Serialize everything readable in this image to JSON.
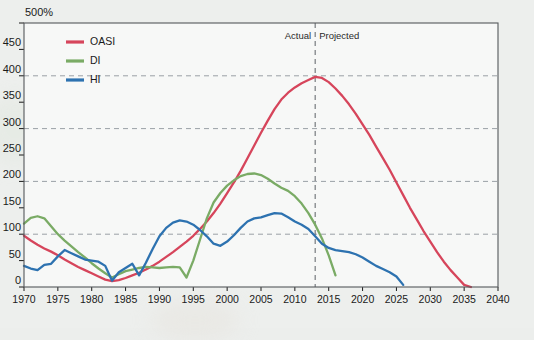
{
  "chart_data": {
    "type": "line",
    "title": "",
    "xlabel": "",
    "ylabel": "",
    "unit_label": "500%",
    "xlim": [
      1970,
      2040
    ],
    "ylim": [
      0,
      500
    ],
    "yticks": [
      0,
      50,
      100,
      150,
      200,
      250,
      300,
      350,
      400,
      450,
      500
    ],
    "ytick_labels": [
      "0",
      "50",
      "100",
      "150",
      "200",
      "250",
      "300",
      "350",
      "400",
      "450",
      "500%"
    ],
    "gridlines_y": [
      100,
      200,
      300,
      400
    ],
    "xticks": [
      1970,
      1975,
      1980,
      1985,
      1990,
      1995,
      2000,
      2005,
      2010,
      2015,
      2020,
      2025,
      2030,
      2035,
      2040
    ],
    "xtick_labels": [
      "1970",
      "1975",
      "1980",
      "1985",
      "1990",
      "1995",
      "2000",
      "2005",
      "2010",
      "2015",
      "2020",
      "2025",
      "2030",
      "2035",
      "2040"
    ],
    "grid": true,
    "legend_position": "top-left",
    "annotations": [
      {
        "name": "actual-label",
        "text": "Actual",
        "x": 2013,
        "align": "right"
      },
      {
        "name": "projected-label",
        "text": "Projected",
        "x": 2013,
        "align": "left"
      },
      {
        "name": "divider",
        "text": "",
        "x": 2013,
        "style": "dashed-vertical"
      }
    ],
    "series": [
      {
        "name": "OASI",
        "color": "#d6455b",
        "x": [
          1970,
          1971,
          1972,
          1973,
          1974,
          1975,
          1976,
          1977,
          1978,
          1979,
          1980,
          1981,
          1982,
          1983,
          1984,
          1985,
          1986,
          1987,
          1988,
          1989,
          1990,
          1991,
          1992,
          1993,
          1994,
          1995,
          1996,
          1997,
          1998,
          1999,
          2000,
          2001,
          2002,
          2003,
          2004,
          2005,
          2006,
          2007,
          2008,
          2009,
          2010,
          2011,
          2012,
          2013,
          2014,
          2015,
          2016,
          2017,
          2018,
          2019,
          2020,
          2021,
          2022,
          2023,
          2024,
          2025,
          2026,
          2027,
          2028,
          2029,
          2030,
          2031,
          2032,
          2033,
          2034,
          2035,
          2036
        ],
        "y": [
          97,
          88,
          80,
          73,
          67,
          60,
          52,
          45,
          38,
          32,
          26,
          20,
          14,
          11,
          13,
          17,
          22,
          27,
          33,
          40,
          48,
          57,
          66,
          76,
          86,
          97,
          110,
          124,
          140,
          158,
          178,
          198,
          220,
          244,
          268,
          292,
          315,
          337,
          355,
          368,
          378,
          386,
          392,
          398,
          396,
          388,
          376,
          362,
          346,
          328,
          308,
          288,
          266,
          244,
          222,
          198,
          174,
          150,
          128,
          106,
          86,
          66,
          48,
          32,
          18,
          4,
          0
        ]
      },
      {
        "name": "DI",
        "color": "#7aab65",
        "x": [
          1970,
          1971,
          1972,
          1973,
          1974,
          1975,
          1976,
          1977,
          1978,
          1979,
          1980,
          1981,
          1982,
          1983,
          1984,
          1985,
          1986,
          1987,
          1988,
          1989,
          1990,
          1991,
          1992,
          1993,
          1994,
          1995,
          1996,
          1997,
          1998,
          1999,
          2000,
          2001,
          2002,
          2003,
          2004,
          2005,
          2006,
          2007,
          2008,
          2009,
          2010,
          2011,
          2012,
          2013,
          2014,
          2015,
          2016
        ],
        "y": [
          120,
          131,
          134,
          130,
          115,
          100,
          88,
          77,
          66,
          56,
          45,
          35,
          26,
          18,
          24,
          30,
          33,
          36,
          38,
          37,
          36,
          37,
          38,
          37,
          18,
          50,
          90,
          130,
          160,
          178,
          192,
          202,
          210,
          214,
          215,
          212,
          205,
          196,
          188,
          182,
          172,
          158,
          140,
          118,
          92,
          60,
          22
        ]
      },
      {
        "name": "HI",
        "color": "#2d72b0",
        "x": [
          1970,
          1971,
          1972,
          1973,
          1974,
          1975,
          1976,
          1977,
          1978,
          1979,
          1980,
          1981,
          1982,
          1983,
          1984,
          1985,
          1986,
          1987,
          1988,
          1989,
          1990,
          1991,
          1992,
          1993,
          1994,
          1995,
          1996,
          1997,
          1998,
          1999,
          2000,
          2001,
          2002,
          2003,
          2004,
          2005,
          2006,
          2007,
          2008,
          2009,
          2010,
          2011,
          2012,
          2013,
          2014,
          2015,
          2016,
          2017,
          2018,
          2019,
          2020,
          2021,
          2022,
          2023,
          2024,
          2025,
          2026
        ],
        "y": [
          40,
          35,
          32,
          42,
          44,
          58,
          70,
          64,
          58,
          52,
          50,
          48,
          40,
          12,
          28,
          36,
          44,
          22,
          46,
          72,
          96,
          112,
          122,
          126,
          124,
          118,
          108,
          96,
          82,
          78,
          86,
          98,
          112,
          124,
          130,
          132,
          136,
          140,
          139,
          132,
          124,
          118,
          110,
          96,
          82,
          74,
          70,
          68,
          66,
          62,
          56,
          48,
          40,
          34,
          28,
          20,
          4
        ]
      }
    ]
  },
  "legend": {
    "items": [
      {
        "label": "OASI",
        "color": "#d6455b"
      },
      {
        "label": "DI",
        "color": "#7aab65"
      },
      {
        "label": "HI",
        "color": "#2d72b0"
      }
    ]
  }
}
